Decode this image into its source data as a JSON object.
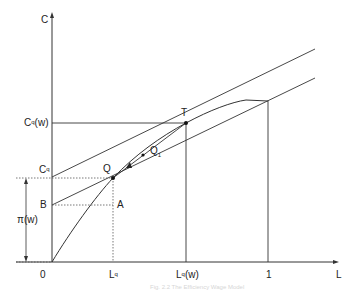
{
  "diagram": {
    "axes": {
      "y_label": "C",
      "x_label": "L"
    },
    "y_labels": {
      "cq_w": {
        "base": "C",
        "sup": "q",
        "suffix": "(w)"
      },
      "cq": {
        "base": "C",
        "sup": "q"
      },
      "b": "B",
      "pi_w": "π(w)"
    },
    "x_labels": {
      "origin": "0",
      "lq": {
        "base": "L",
        "sup": "q"
      },
      "lq_w": {
        "base": "L",
        "sup": "q",
        "suffix": "(w)"
      },
      "one": "1"
    },
    "points": {
      "t": "T",
      "q": "Q",
      "q1": {
        "base": "Q",
        "sub": "1"
      },
      "a": "A"
    },
    "caption": "Fig. 2.2   The Efficiency Wage Model"
  }
}
